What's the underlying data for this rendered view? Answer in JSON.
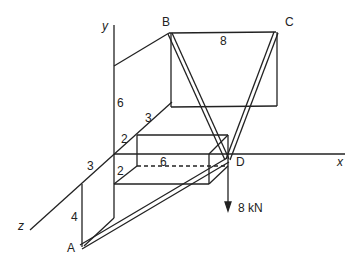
{
  "axes": {
    "x": "x",
    "y": "y",
    "z": "z"
  },
  "points": {
    "A": "A",
    "B": "B",
    "C": "C",
    "D": "D"
  },
  "dimensions": {
    "bc": "8",
    "y_height": "6",
    "z_back": "3",
    "box_depth": "2",
    "box_height": "2",
    "box_length": "6",
    "z_front": "3",
    "a_height": "4"
  },
  "load": "8 kN",
  "colors": {
    "line": "#222222",
    "background": "#ffffff"
  }
}
